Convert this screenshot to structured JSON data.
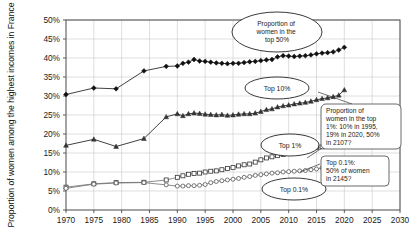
{
  "chart_data": {
    "type": "line",
    "title": "",
    "xlabel": "",
    "ylabel": "Proportion of women among the highest incomes in France",
    "xlim": [
      1970,
      2030
    ],
    "ylim": [
      0,
      50
    ],
    "grid": true,
    "legend_position": "none",
    "x_ticks": [
      "1970",
      "1975",
      "1980",
      "1985",
      "1990",
      "1995",
      "2000",
      "2005",
      "2010",
      "2015",
      "2020",
      "2025",
      "2030"
    ],
    "y_ticks": [
      "0%",
      "5%",
      "10%",
      "15%",
      "20%",
      "25%",
      "30%",
      "35%",
      "40%",
      "45%",
      "50%"
    ],
    "series": [
      {
        "name": "Top 50%",
        "marker": "filled-diamond",
        "x": [
          1970,
          1975,
          1979,
          1984,
          1988,
          1990,
          1991,
          1992,
          1993,
          1994,
          1995,
          1996,
          1997,
          1998,
          1999,
          2000,
          2001,
          2002,
          2003,
          2004,
          2005,
          2006,
          2007,
          2008,
          2009,
          2010,
          2011,
          2012,
          2013,
          2014,
          2015,
          2016,
          2017,
          2018,
          2019,
          2020
        ],
        "values": [
          30.4,
          32.1,
          31.9,
          36.6,
          37.8,
          37.9,
          38.6,
          38.9,
          39.6,
          39.2,
          39.1,
          38.9,
          38.7,
          38.6,
          38.5,
          38.6,
          38.6,
          38.8,
          39.0,
          39.1,
          39.3,
          39.5,
          39.6,
          40.3,
          40.6,
          40.5,
          40.4,
          40.5,
          40.6,
          40.8,
          41.1,
          41.3,
          41.4,
          41.6,
          42.1,
          42.8
        ]
      },
      {
        "name": "Top 10%",
        "marker": "filled-triangle",
        "x": [
          1970,
          1975,
          1979,
          1984,
          1988,
          1990,
          1991,
          1992,
          1993,
          1994,
          1995,
          1996,
          1997,
          1998,
          1999,
          2000,
          2001,
          2002,
          2003,
          2004,
          2005,
          2006,
          2007,
          2008,
          2009,
          2010,
          2011,
          2012,
          2013,
          2014,
          2015,
          2016,
          2017,
          2018,
          2019,
          2020
        ],
        "values": [
          17.0,
          18.6,
          16.7,
          18.8,
          24.5,
          25.3,
          24.8,
          25.3,
          25.5,
          25.4,
          25.2,
          25.1,
          25.0,
          25.1,
          24.9,
          25.0,
          25.2,
          25.3,
          25.3,
          25.5,
          25.9,
          26.4,
          26.6,
          27.1,
          27.4,
          27.6,
          27.9,
          28.1,
          28.3,
          28.6,
          29.0,
          29.3,
          29.5,
          29.8,
          30.2,
          31.6
        ]
      },
      {
        "name": "Top 1%",
        "marker": "open-square",
        "x": [
          1970,
          1975,
          1979,
          1984,
          1988,
          1990,
          1991,
          1992,
          1993,
          1994,
          1995,
          1996,
          1997,
          1998,
          1999,
          2000,
          2001,
          2002,
          2003,
          2004,
          2005,
          2006,
          2007,
          2008,
          2009,
          2010,
          2011,
          2012,
          2013,
          2014,
          2015,
          2016,
          2017,
          2018,
          2019,
          2020
        ],
        "values": [
          6.0,
          6.9,
          7.2,
          7.3,
          7.9,
          8.6,
          9.0,
          9.4,
          9.6,
          9.7,
          10.0,
          10.2,
          10.3,
          10.6,
          10.9,
          11.2,
          11.6,
          11.9,
          12.1,
          12.6,
          13.2,
          13.7,
          14.0,
          14.3,
          14.6,
          15.0,
          15.4,
          15.6,
          15.9,
          16.2,
          16.4,
          16.6,
          16.8,
          17.0,
          17.4,
          19.0
        ]
      },
      {
        "name": "Top 0.1%",
        "marker": "open-circle",
        "x": [
          1970,
          1975,
          1979,
          1984,
          1988,
          1990,
          1991,
          1992,
          1993,
          1994,
          1995,
          1996,
          1997,
          1998,
          1999,
          2000,
          2001,
          2002,
          2003,
          2004,
          2005,
          2006,
          2007,
          2008,
          2009,
          2010,
          2011,
          2012,
          2013,
          2014,
          2015,
          2016,
          2017,
          2018,
          2019,
          2020
        ],
        "values": [
          5.7,
          6.8,
          7.1,
          7.2,
          6.6,
          6.3,
          6.3,
          6.4,
          6.4,
          6.5,
          6.7,
          7.2,
          7.5,
          7.7,
          7.9,
          8.1,
          8.3,
          8.6,
          8.8,
          9.1,
          9.3,
          9.5,
          9.7,
          9.8,
          10.0,
          10.1,
          10.2,
          10.3,
          10.4,
          10.6,
          10.8,
          11.1,
          11.4,
          11.7,
          12.0,
          12.4
        ]
      }
    ],
    "annotations": [
      {
        "id": "ann-top50",
        "shape": "oval",
        "text": "Proportion of\nwomen in the\ntop 50%"
      },
      {
        "id": "ann-top10",
        "shape": "oval",
        "text": "Top 10%"
      },
      {
        "id": "ann-top1",
        "shape": "oval",
        "text": "Top 1%"
      },
      {
        "id": "ann-top01",
        "shape": "oval",
        "text": "Top 0.1%"
      },
      {
        "id": "ann-box-top1",
        "shape": "box",
        "text": "Proportion of\nwomen in the top\n1%: 10% in 1995,\n19% in 2020, 50%\nin 2107?"
      },
      {
        "id": "ann-box-top01",
        "shape": "box",
        "text": "Top 0.1%:\n50% of women\nin 2145?"
      }
    ]
  },
  "labels": {
    "y_axis_title": "Proportion of women among the highest incomes in France",
    "oval_top50_l1": "Proportion of",
    "oval_top50_l2": "women in the",
    "oval_top50_l3": "top 50%",
    "oval_top10": "Top 10%",
    "oval_top1": "Top 1%",
    "oval_top01": "Top 0.1%",
    "box1_l1": "Proportion of",
    "box1_l2": "women in the top",
    "box1_l3": "1%: 10% in 1995,",
    "box1_l4": "19% in 2020, 50%",
    "box1_l5": "in 2107?",
    "box2_l1": "Top 0.1%:",
    "box2_l2": "50% of women",
    "box2_l3": "in 2145?",
    "x0": "1970",
    "x1": "1975",
    "x2": "1980",
    "x3": "1985",
    "x4": "1990",
    "x5": "1995",
    "x6": "2000",
    "x7": "2005",
    "x8": "2010",
    "x9": "2015",
    "x10": "2020",
    "x11": "2025",
    "x12": "2030",
    "y0": "0%",
    "y1": "5%",
    "y2": "10%",
    "y3": "15%",
    "y4": "20%",
    "y5": "25%",
    "y6": "30%",
    "y7": "35%",
    "y8": "40%",
    "y9": "45%",
    "y10": "50%"
  }
}
